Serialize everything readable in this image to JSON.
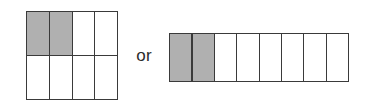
{
  "figure": {
    "kind": "fraction-area-models",
    "connector_text": "or",
    "background_color": "#ffffff",
    "stroke_color": "#3a3a3a",
    "shaded_color": "#b0b0b0",
    "unshaded_color": "#ffffff"
  },
  "chart_data": {
    "type": "table",
    "title": "",
    "xlabel": "",
    "ylabel": "",
    "models": [
      {
        "name": "left-grid-model",
        "columns": 4,
        "rows": 2,
        "total_cells": 8,
        "shaded_cells": 2,
        "fraction": "2/8",
        "shaded_indices": [
          0,
          1
        ],
        "cells": [
          {
            "index": 0,
            "row": 1,
            "col": 1,
            "state": "shaded"
          },
          {
            "index": 1,
            "row": 1,
            "col": 2,
            "state": "shaded"
          },
          {
            "index": 2,
            "row": 1,
            "col": 3,
            "state": "unshaded"
          },
          {
            "index": 3,
            "row": 1,
            "col": 4,
            "state": "unshaded"
          },
          {
            "index": 4,
            "row": 2,
            "col": 1,
            "state": "unshaded"
          },
          {
            "index": 5,
            "row": 2,
            "col": 2,
            "state": "unshaded"
          },
          {
            "index": 6,
            "row": 2,
            "col": 3,
            "state": "unshaded"
          },
          {
            "index": 7,
            "row": 2,
            "col": 4,
            "state": "unshaded"
          }
        ]
      },
      {
        "name": "right-strip-model",
        "columns": 8,
        "rows": 1,
        "total_cells": 8,
        "shaded_cells": 2,
        "fraction": "2/8",
        "shaded_indices": [
          0,
          1
        ],
        "cells": [
          {
            "index": 0,
            "row": 1,
            "col": 1,
            "state": "shaded"
          },
          {
            "index": 1,
            "row": 1,
            "col": 2,
            "state": "shaded"
          },
          {
            "index": 2,
            "row": 1,
            "col": 3,
            "state": "unshaded"
          },
          {
            "index": 3,
            "row": 1,
            "col": 4,
            "state": "unshaded"
          },
          {
            "index": 4,
            "row": 1,
            "col": 5,
            "state": "unshaded"
          },
          {
            "index": 5,
            "row": 1,
            "col": 6,
            "state": "unshaded"
          },
          {
            "index": 6,
            "row": 1,
            "col": 7,
            "state": "unshaded"
          },
          {
            "index": 7,
            "row": 1,
            "col": 8,
            "state": "unshaded"
          }
        ]
      }
    ]
  }
}
